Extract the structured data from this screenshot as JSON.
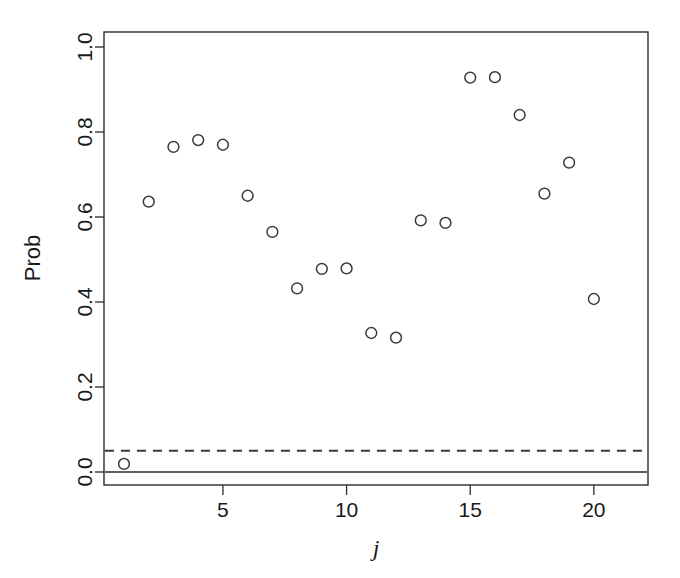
{
  "chart_data": {
    "type": "scatter",
    "title": "",
    "xlabel": "j",
    "ylabel": "Prob",
    "x": [
      1,
      2,
      3,
      4,
      5,
      6,
      7,
      8,
      9,
      10,
      11,
      12,
      13,
      14,
      15,
      16,
      17,
      18,
      19,
      20
    ],
    "values": [
      0.019,
      0.636,
      0.765,
      0.781,
      0.77,
      0.65,
      0.565,
      0.432,
      0.478,
      0.479,
      0.327,
      0.316,
      0.592,
      0.586,
      0.928,
      0.929,
      0.84,
      0.655,
      0.728,
      0.407
    ],
    "xlim": [
      0.3,
      21.0
    ],
    "ylim": [
      -0.03,
      1.04
    ],
    "xticks": [
      5,
      10,
      15,
      20
    ],
    "xtick_labels": [
      "5",
      "10",
      "15",
      "20"
    ],
    "yticks": [
      0.0,
      0.2,
      0.4,
      0.6,
      0.8,
      1.0
    ],
    "ytick_labels": [
      "0.0",
      "0.2",
      "0.4",
      "0.6",
      "0.8",
      "1.0"
    ],
    "grid": false,
    "legend": null,
    "marker": "open-circle",
    "marker_color": "#3a3a44",
    "reference_lines": [
      {
        "name": "zero-line",
        "y": 0.0,
        "style": "solid",
        "color": "#2b2b2b"
      },
      {
        "name": "significance-threshold-line",
        "y": 0.05,
        "style": "dashed",
        "color": "#3a3a3a"
      }
    ]
  },
  "axes": {
    "y_axis_title": "Prob",
    "x_axis_title": "j"
  },
  "colors": {
    "background": "#ffffff",
    "foreground": "#1a1a1a",
    "marker": "#3a3a44",
    "frame": "#2b2b2b"
  }
}
